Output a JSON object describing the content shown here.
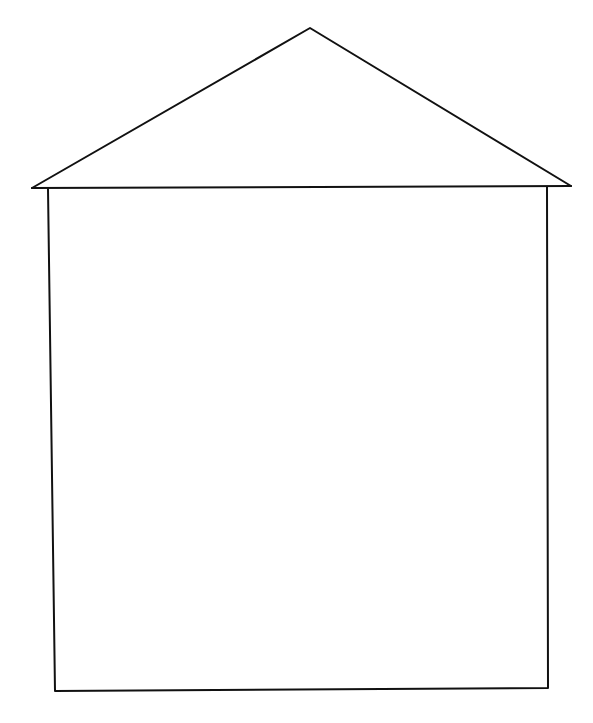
{
  "drawing": {
    "subject": "house outline",
    "stroke_color": "#111111",
    "background_color": "#ffffff",
    "stroke_width": 2,
    "roof": {
      "apex": [
        310,
        28
      ],
      "left_eave": [
        32,
        188
      ],
      "right_eave": [
        571,
        186
      ]
    },
    "walls": {
      "left_top": [
        48,
        189
      ],
      "left_bottom": [
        55,
        691
      ],
      "right_top": [
        547,
        187
      ],
      "right_bottom": [
        548,
        688
      ]
    }
  }
}
